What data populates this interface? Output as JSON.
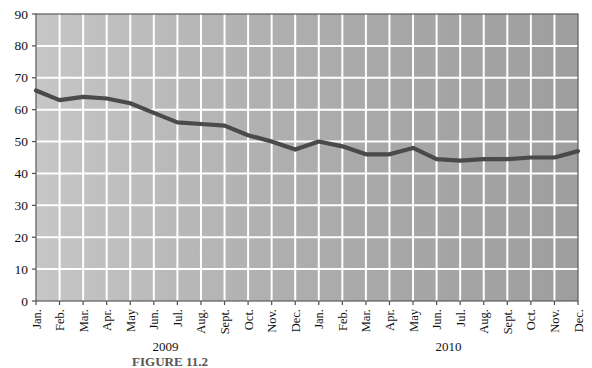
{
  "chart_data": {
    "type": "line",
    "title": "",
    "subtitle": "",
    "xlabel": "",
    "ylabel": "",
    "ylim": [
      0,
      90
    ],
    "ytick_values": [
      0,
      10,
      20,
      30,
      40,
      50,
      60,
      70,
      80,
      90
    ],
    "ytick_labels": [
      "0",
      "10",
      "20",
      "30",
      "40",
      "50",
      "60",
      "70",
      "80",
      "90"
    ],
    "grid": true,
    "legend": "none",
    "categories": [
      "Jan.",
      "Feb.",
      "Mar.",
      "Apr.",
      "May",
      "Jun.",
      "Jul.",
      "Aug.",
      "Sept.",
      "Oct.",
      "Nov.",
      "Dec.",
      "Jan.",
      "Feb.",
      "Mar.",
      "Apr.",
      "May",
      "Jun.",
      "Jul.",
      "Aug.",
      "Sept.",
      "Oct.",
      "Nov.",
      "Dec."
    ],
    "values": [
      66,
      63,
      64,
      63.5,
      62,
      59,
      56,
      55.5,
      55,
      52,
      50,
      47.5,
      50,
      48.5,
      46,
      46,
      48,
      44.5,
      44,
      44.5,
      44.5,
      45,
      45,
      47
    ],
    "group_labels": [
      {
        "text": "2009",
        "span_start": 0,
        "span_end": 11
      },
      {
        "text": "2010",
        "span_start": 12,
        "span_end": 23
      }
    ],
    "series": [
      {
        "name": "value",
        "color": "#4a4a4a",
        "values": [
          66,
          63,
          64,
          63.5,
          62,
          59,
          56,
          55.5,
          55,
          52,
          50,
          47.5,
          50,
          48.5,
          46,
          46,
          48,
          44.5,
          44,
          44.5,
          44.5,
          45,
          45,
          47
        ]
      }
    ],
    "colors": {
      "plot_background_light": "#c2c2c2",
      "plot_background_dark": "#a3a3a3",
      "gridline": "#ffffff",
      "axis": "#4d4d4d",
      "line": "#4a4a4a"
    }
  },
  "caption": {
    "text": "FIGURE 11.2"
  }
}
